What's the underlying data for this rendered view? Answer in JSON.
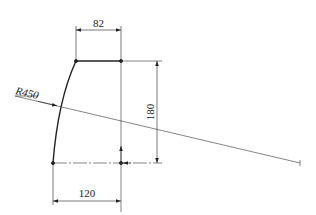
{
  "drawing": {
    "type": "engineering-dimension-drawing",
    "dimensions": {
      "top_width": "82",
      "height": "180",
      "bottom_width": "120",
      "radius": "R450"
    },
    "colors": {
      "line": "#222222",
      "background": "#ffffff"
    }
  }
}
